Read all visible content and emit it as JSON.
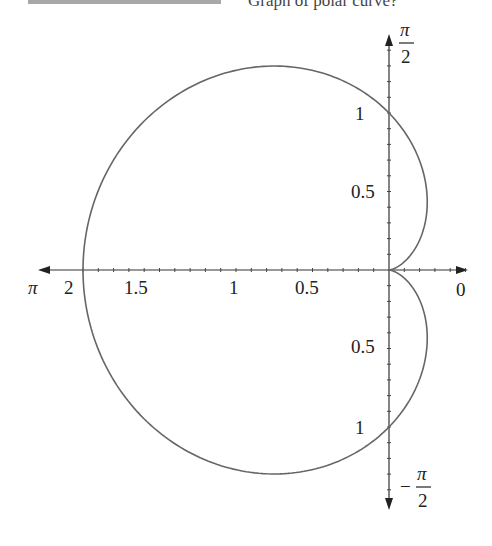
{
  "header": {
    "question_fragment": "Graph of polar curve?"
  },
  "chart_data": {
    "type": "line",
    "subtype": "polar",
    "title": "",
    "equation": "r = 1 - cos(theta)",
    "curve": "cardioid",
    "r_axis_ticks_step": 0.1,
    "r_range": [
      0,
      2
    ],
    "angle_labels": {
      "right": "0",
      "top": "π/2",
      "left": "π",
      "bottom": "−π/2"
    },
    "x_axis_tick_labels": [
      {
        "value": 2,
        "label": "2"
      },
      {
        "value": 1.5,
        "label": "1.5"
      },
      {
        "value": 1,
        "label": "1"
      },
      {
        "value": 0.5,
        "label": "0.5"
      }
    ],
    "y_axis_tick_labels": [
      {
        "value": 1,
        "label": "1"
      },
      {
        "value": 0.5,
        "label": "0.5"
      },
      {
        "value": -0.5,
        "label": "0.5"
      },
      {
        "value": -1,
        "label": "1"
      }
    ],
    "key_points": [
      {
        "theta": "0",
        "r": 0
      },
      {
        "theta": "π/2",
        "r": 1
      },
      {
        "theta": "π",
        "r": 2
      },
      {
        "theta": "3π/2",
        "r": 1
      }
    ],
    "grid": false,
    "legend": null,
    "colors": {
      "curve": "#666666",
      "axes": "#333333"
    }
  },
  "labels": {
    "pi": "π",
    "two": "2",
    "zero": "0",
    "minus": "−",
    "x_2": "2",
    "x_15": "1.5",
    "x_1": "1",
    "x_05": "0.5",
    "y_1_top": "1",
    "y_05_top": "0.5",
    "y_05_bottom": "0.5",
    "y_1_bottom": "1"
  }
}
